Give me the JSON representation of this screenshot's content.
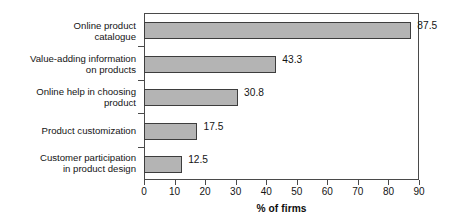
{
  "chart_data": {
    "type": "bar",
    "orientation": "horizontal",
    "title": "",
    "xlabel": "% of firms",
    "ylabel": "",
    "categories": [
      "Online product catalogue",
      "Value-adding information on products",
      "Online help in choosing product",
      "Product customization",
      "Customer participation in product design"
    ],
    "values": [
      87.5,
      43.3,
      30.8,
      17.5,
      12.5
    ],
    "value_labels": [
      "87.5",
      "43.3",
      "30.8",
      "17.5",
      "12.5"
    ],
    "xlim": [
      0,
      90
    ],
    "xticks": [
      0,
      10,
      20,
      30,
      40,
      50,
      60,
      70,
      80,
      90
    ],
    "xtick_labels": [
      "0",
      "10",
      "20",
      "30",
      "40",
      "50",
      "60",
      "70",
      "80",
      "90"
    ],
    "grid": false,
    "legend": null,
    "bar_fill_color": "#b4b4b4",
    "bar_border_color": "#3d3d3d",
    "axis_color": "#4a4a4a",
    "background_color": "#ffffff"
  },
  "categories_wrapped": [
    {
      "line1": "Online product",
      "line2": "catalogue"
    },
    {
      "line1": "Value-adding information",
      "line2": "on products"
    },
    {
      "line1": "Online help in choosing",
      "line2": "product"
    },
    {
      "line1": "Product customization",
      "line2": ""
    },
    {
      "line1": "Customer participation",
      "line2": "in product design"
    }
  ]
}
